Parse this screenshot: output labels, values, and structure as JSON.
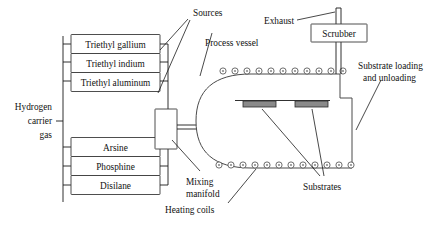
{
  "diagram": {
    "colors": {
      "line": "#1a1a1a",
      "vessel_stroke": "#4a4a4a",
      "substrate_fill": "#8a8a8a",
      "coil_fill": "#8c8c8c",
      "background": "#ffffff"
    },
    "source_boxes": [
      {
        "id": "triethyl-gallium",
        "label": "Triethyl gallium"
      },
      {
        "id": "triethyl-indium",
        "label": "Triethyl indium"
      },
      {
        "id": "triethyl-aluminum",
        "label": "Triethyl aluminum"
      },
      {
        "id": "arsine",
        "label": "Arsine"
      },
      {
        "id": "phosphine",
        "label": "Phosphine"
      },
      {
        "id": "disilane",
        "label": "Disilane"
      }
    ],
    "equipment": {
      "scrubber_label": "Scrubber"
    },
    "callouts": {
      "sources": "Sources",
      "exhaust": "Exhaust",
      "process_vessel": "Process vessel",
      "substrate_loading_line1": "Substrate loading",
      "substrate_loading_line2": "and unloading",
      "substrates": "Substrates",
      "heating_coils": "Heating coils",
      "mixing_line1": "Mixing",
      "mixing_line2": "manifold",
      "hydrogen_line1": "Hydrogen",
      "hydrogen_line2": "carrier",
      "hydrogen_line3": "gas"
    },
    "counts": {
      "top_coils": 11,
      "bottom_coils": 12,
      "substrate_bars": 2
    }
  }
}
